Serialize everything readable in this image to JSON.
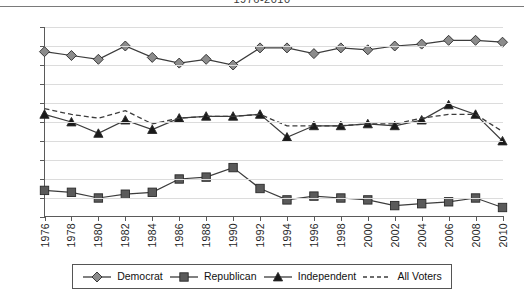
{
  "title": "1976-2010",
  "axes": {
    "y_ticks": [
      "0%",
      "10%",
      "20%",
      "30%",
      "40%",
      "50%",
      "60%",
      "70%",
      "80%",
      "90%",
      "100%"
    ],
    "x_ticks": [
      "1976",
      "1978",
      "1980",
      "1982",
      "1984",
      "1986",
      "1988",
      "1990",
      "1992",
      "1994",
      "1996",
      "1998",
      "2000",
      "2002",
      "2004",
      "2006",
      "2008",
      "2010"
    ]
  },
  "legend": {
    "items": [
      {
        "label": "Democrat",
        "marker": "diamond-marker",
        "dash": false
      },
      {
        "label": "Republican",
        "marker": "square-marker",
        "dash": false
      },
      {
        "label": "Independent",
        "marker": "triangle-marker",
        "dash": false
      },
      {
        "label": "All Voters",
        "marker": "dashed-line",
        "dash": true
      }
    ]
  },
  "colors": {
    "line": "#3c3c3c",
    "marker_fill_democrat": "#8c8c8c",
    "marker_fill_republican": "#5a5a5a",
    "marker_fill_independent": "#1a1a1a",
    "gridline": "#dcdcdc",
    "axis": "#5a5a5a",
    "background": "#ffffff"
  },
  "chart_data": {
    "type": "line",
    "title": "1976-2010",
    "xlabel": "",
    "ylabel": "",
    "ylim": [
      0,
      100
    ],
    "y_tick_step": 10,
    "grid": true,
    "legend_position": "bottom",
    "categories": [
      "1976",
      "1978",
      "1980",
      "1982",
      "1984",
      "1986",
      "1988",
      "1990",
      "1992",
      "1994",
      "1996",
      "1998",
      "2000",
      "2002",
      "2004",
      "2006",
      "2008",
      "2010"
    ],
    "series": [
      {
        "name": "Democrat",
        "marker": "diamond",
        "linestyle": "solid",
        "values": [
          87,
          85,
          83,
          90,
          84,
          81,
          83,
          80,
          89,
          89,
          86,
          89,
          88,
          90,
          91,
          93,
          93,
          92
        ]
      },
      {
        "name": "Republican",
        "marker": "square",
        "linestyle": "solid",
        "values": [
          14,
          13,
          10,
          12,
          13,
          20,
          21,
          26,
          15,
          9,
          11,
          10,
          9,
          6,
          7,
          8,
          10,
          5
        ]
      },
      {
        "name": "Independent",
        "marker": "triangle",
        "linestyle": "solid",
        "values": [
          54,
          50,
          44,
          51,
          46,
          52,
          53,
          53,
          54,
          42,
          48,
          48,
          49,
          48,
          51,
          59,
          54,
          40
        ]
      },
      {
        "name": "All Voters",
        "marker": "none",
        "linestyle": "dashed",
        "values": [
          57,
          54,
          52,
          56,
          49,
          52,
          53,
          53,
          54,
          48,
          48,
          48,
          49,
          49,
          52,
          54,
          54,
          45
        ]
      }
    ]
  }
}
